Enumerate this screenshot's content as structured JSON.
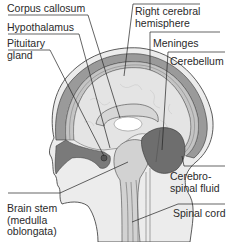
{
  "diagram": {
    "type": "anatomical-cross-section",
    "colors": {
      "background": "#ffffff",
      "skin": "#ececec",
      "skull_band": "#9a9a9a",
      "meninges_band": "#c4c4c4",
      "brain_tissue": "#e4e4e4",
      "cerebellum": "#6e6e6e",
      "brain_stem": "#d2d2d2",
      "csf_dark": "#7a7a7a",
      "outline": "#333333",
      "leader_line": "#222222",
      "text": "#2a2a2a"
    },
    "labels": [
      {
        "id": "corpus-callosum",
        "text": "Corpus callosum",
        "lines": [
          "Corpus callosum"
        ]
      },
      {
        "id": "hypothalamus",
        "text": "Hypothalamus",
        "lines": [
          "Hypothalamus"
        ]
      },
      {
        "id": "pituitary-gland",
        "text": "Pituitary gland",
        "lines": [
          "Pituitary",
          "gland"
        ]
      },
      {
        "id": "right-cerebral-hemisphere",
        "text": "Right cerebral hemisphere",
        "lines": [
          "Right cerebral",
          "hemisphere"
        ]
      },
      {
        "id": "meninges",
        "text": "Meninges",
        "lines": [
          "Meninges"
        ]
      },
      {
        "id": "cerebellum",
        "text": "Cerebellum",
        "lines": [
          "Cerebellum"
        ]
      },
      {
        "id": "cerebrospinal-fluid",
        "text": "Cerebrospinal fluid",
        "lines": [
          "Cerebro-",
          "spinal fluid"
        ]
      },
      {
        "id": "brain-stem",
        "text": "Brain stem (medulla oblongata)",
        "lines": [
          "Brain stem",
          "(medulla",
          "oblongata)"
        ]
      },
      {
        "id": "spinal-cord",
        "text": "Spinal cord",
        "lines": [
          "Spinal cord"
        ]
      }
    ]
  }
}
